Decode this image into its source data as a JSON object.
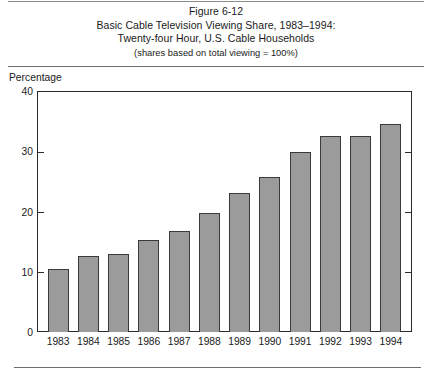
{
  "figure": {
    "number_line": "Figure 6-12",
    "title_line_1": "Basic Cable Television Viewing Share, 1983–1994:",
    "title_line_2": "Twenty-four Hour, U.S. Cable Households",
    "subtitle": "(shares based on total viewing = 100%)",
    "y_axis_caption": "Percentage",
    "footer_note": ""
  },
  "colors": {
    "bar_fill": "#9b9b9b",
    "bar_border": "#3a3a3a",
    "frame": "#2b2b2b",
    "rule": "#6e6e6e",
    "text": "#1a1a1a"
  },
  "chart_data": {
    "type": "bar",
    "title": "Basic Cable Television Viewing Share, 1983–1994: Twenty-four Hour, U.S. Cable Households",
    "subtitle": "(shares based on total viewing = 100%)",
    "xlabel": "",
    "ylabel": "Percentage",
    "ylim": [
      0,
      40
    ],
    "yticks": [
      0,
      10,
      20,
      30,
      40
    ],
    "ytick_labels": [
      "0",
      "10",
      "20",
      "30",
      "40"
    ],
    "grid": false,
    "legend": null,
    "categories": [
      "1983",
      "1984",
      "1985",
      "1986",
      "1987",
      "1988",
      "1989",
      "1990",
      "1991",
      "1992",
      "1993",
      "1994"
    ],
    "values": [
      10.4,
      12.6,
      12.9,
      15.2,
      16.8,
      19.7,
      23.0,
      25.8,
      29.8,
      32.5,
      32.5,
      34.6
    ]
  }
}
